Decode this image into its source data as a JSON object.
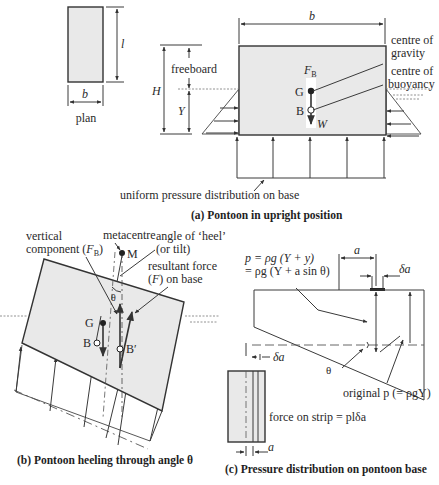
{
  "figure_a": {
    "plan": {
      "label": "plan",
      "dim_length": "l",
      "dim_width": "b"
    },
    "elevation": {
      "dim_width": "b",
      "dim_height": "H",
      "dim_draft": "Y",
      "freeboard": "freeboard",
      "buoyancy_force": "F",
      "buoyancy_force_sub": "B",
      "point_g": "G",
      "point_b": "B",
      "weight": "W",
      "centre_of_gravity": [
        "centre of",
        "gravity"
      ],
      "centre_of_buoyancy": [
        "centre of",
        "buoyancy"
      ],
      "pressure_note": "uniform pressure distribution on base"
    },
    "caption": "(a)  Pontoon in upright position"
  },
  "figure_b": {
    "metacentre": "metacentre",
    "point_m": "M",
    "vertical_component": [
      "vertical",
      "component (",
      "F",
      "B",
      ")"
    ],
    "heel_angle": [
      "angle of ‘heel’",
      "(or tilt)"
    ],
    "resultant_force": [
      "resultant force",
      "(",
      "F",
      ") on base"
    ],
    "theta": "θ",
    "point_g": "G",
    "point_b": "B",
    "point_b_prime": "B′",
    "caption": "(b)  Pontoon heeling through angle θ"
  },
  "figure_c": {
    "formula_line1": "p = ρg (Y + y)",
    "formula_line2": "= ρg (Y + a sin θ)",
    "dim_a": "a",
    "dim_delta_a": "δa",
    "dim_delta_a_left": "δa",
    "theta": "θ",
    "original_p": "original p (= ρgY)",
    "force_on_strip": "force on strip = plδa",
    "dim_a_bottom": "a",
    "caption": "(c)  Pressure distribution on pontoon base"
  }
}
